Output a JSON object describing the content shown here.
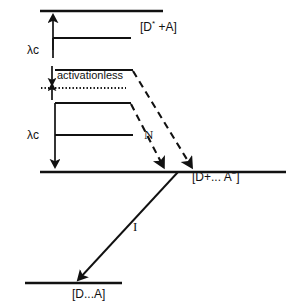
{
  "figure": {
    "type": "energy-level-diagram",
    "background_color": "#ffffff",
    "line_color": "#111111"
  },
  "labels": {
    "excited_state": "[D* +A]",
    "excited_state_base": "[D",
    "excited_state_star": "*",
    "excited_state_rest": " +A]",
    "reorganization_upper": "λc",
    "reorganization_lower": "λc",
    "activationless": "activationless",
    "nonradiative": "N",
    "radiative": "I",
    "charge_separated": "[D+... A−]",
    "charge_separated_base": "[D+... A",
    "charge_separated_sup": "−",
    "charge_separated_close": "]",
    "ground_state": "[D...A]"
  },
  "levels": [
    {
      "name": "top-manifold-level",
      "x1": 40,
      "x2": 163,
      "y": 11
    },
    {
      "name": "excited-state-level",
      "x1": 53,
      "x2": 131,
      "y": 38
    },
    {
      "name": "upper-mid-level",
      "x1": 55,
      "x2": 133,
      "y": 70
    },
    {
      "name": "lower-mid-level",
      "x1": 55,
      "x2": 131,
      "y": 103
    },
    {
      "name": "lower-manifold-level",
      "x1": 55,
      "x2": 133,
      "y": 135
    },
    {
      "name": "charge-separated-level",
      "x1": 40,
      "x2": 286,
      "y": 172
    },
    {
      "name": "ground-state-level",
      "x1": 25,
      "x2": 122,
      "y": 283
    }
  ],
  "arrows": {
    "lambda_upper": {
      "name": "lambda-c-upper-arrow",
      "x": 53,
      "y_from": 50,
      "y_to": 13,
      "direction": "up"
    },
    "lambda_lower": {
      "name": "lambda-c-lower-arrow",
      "x": 55,
      "y_from": 135,
      "y_to": 170,
      "direction": "down"
    },
    "activationless_up": {
      "name": "activationless-up-arrow",
      "x": 52,
      "y_from": 95,
      "y_to": 78
    },
    "activationless_down": {
      "name": "activationless-down-arrow",
      "x": 52,
      "y_from": 72,
      "y_to": 88
    },
    "dashed_outer": {
      "name": "nonradiative-outer-arrow",
      "x1": 133,
      "y1": 71,
      "x2": 192,
      "y2": 170
    },
    "dashed_inner": {
      "name": "nonradiative-inner-arrow",
      "x1": 131,
      "y1": 104,
      "x2": 164,
      "y2": 170
    },
    "radiative": {
      "name": "radiative-decay-arrow",
      "x1": 178,
      "y1": 174,
      "x2": 77,
      "y2": 281
    }
  },
  "dotted_line": {
    "name": "activationless-dotted-line",
    "x1": 41,
    "y1": 88,
    "x2": 126,
    "y2": 88
  },
  "label_positions": {
    "excited_state": {
      "x": 140,
      "y": 26
    },
    "lambda_upper": {
      "x": 28,
      "y": 51
    },
    "activationless": {
      "x": 55,
      "y": 75
    },
    "lambda_lower": {
      "x": 28,
      "y": 136
    },
    "nonradiative": {
      "x": 143,
      "y": 129
    },
    "charge_separated": {
      "x": 193,
      "y": 176
    },
    "radiative": {
      "x": 133,
      "y": 226
    },
    "ground_state": {
      "x": 72,
      "y": 288
    }
  }
}
